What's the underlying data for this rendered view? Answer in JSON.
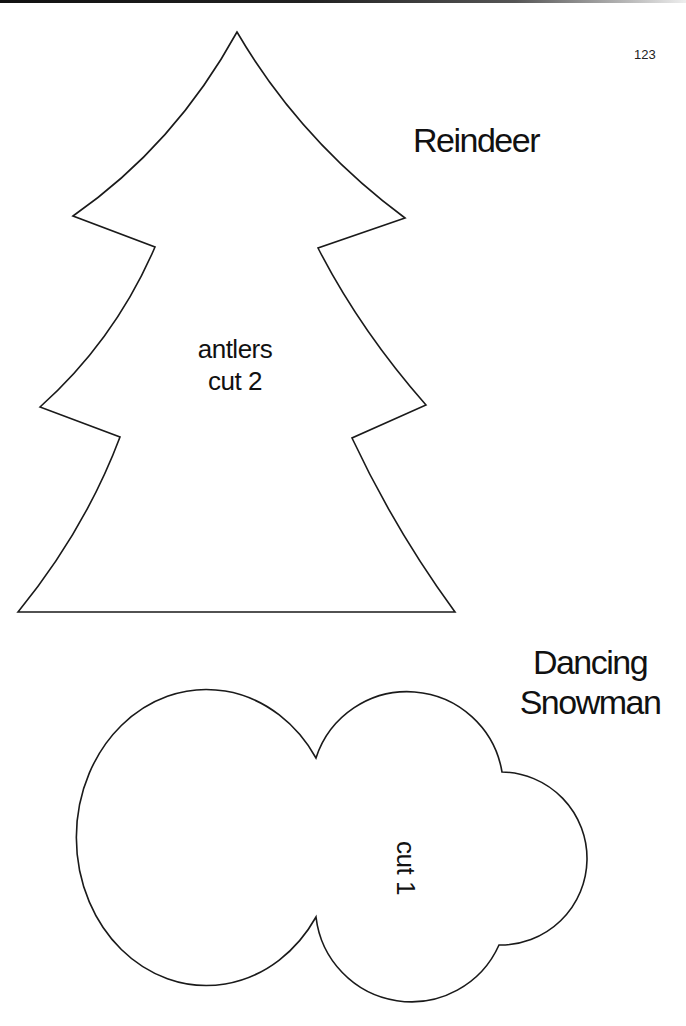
{
  "page": {
    "page_number": "123",
    "ink_color": "#1a1a1a",
    "paper_color": "#ffffff"
  },
  "reindeer": {
    "title": "Reindeer",
    "pattern_shape": "tree-shaped antler pattern",
    "label_line1": "antlers",
    "label_line2": "cut 2"
  },
  "snowman": {
    "title_line1": "Dancing",
    "title_line2": "Snowman",
    "pattern_shape": "three-circle snowman body pattern",
    "label": "cut 1"
  }
}
